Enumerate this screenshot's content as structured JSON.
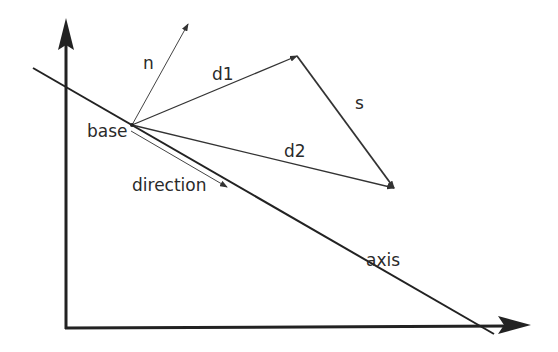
{
  "diagram": {
    "labels": {
      "n": "n",
      "d1": "d1",
      "s": "s",
      "base": "base",
      "d2": "d2",
      "direction": "direction",
      "axis": "axis"
    },
    "colors": {
      "stroke": "#222222",
      "text": "#2a2a2a",
      "background": "#ffffff"
    }
  }
}
